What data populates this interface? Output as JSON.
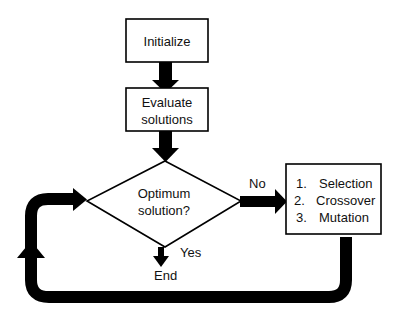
{
  "diagram": {
    "type": "flowchart",
    "nodes": {
      "initialize": {
        "shape": "rectangle",
        "label": "Initialize"
      },
      "evaluate": {
        "shape": "rectangle",
        "lines": [
          "Evaluate",
          "solutions"
        ]
      },
      "decision": {
        "shape": "diamond",
        "lines": [
          "Optimum",
          "solution?"
        ]
      },
      "operators": {
        "shape": "rectangle",
        "items": [
          {
            "num": "1.",
            "text": "Selection"
          },
          {
            "num": "2.",
            "text": "Crossover"
          },
          {
            "num": "3.",
            "text": "Mutation"
          }
        ]
      },
      "end": {
        "shape": "terminal-text",
        "label": "End"
      }
    },
    "edges": {
      "no_label": "No",
      "yes_label": "Yes"
    },
    "colors": {
      "stroke": "#000000",
      "fill": "#ffffff",
      "text": "#111111"
    }
  }
}
